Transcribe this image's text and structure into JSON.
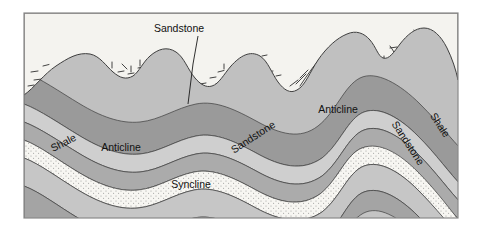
{
  "figure": {
    "type": "geologic-cross-section",
    "title_label": "Sandstone",
    "frame": {
      "x": 24,
      "y": 13,
      "width": 434,
      "height": 205,
      "border_color": "#808080"
    },
    "background_color": "#ffffff"
  },
  "labels": {
    "sandstone_top": "Sandstone",
    "shale_left": "Shale",
    "anticline_left": "Anticline",
    "sandstone_mid": "Sandstone",
    "anticline_right": "Anticline",
    "syncline": "Syncline",
    "sandstone_right": "Sandstone",
    "shale_right": "Shale"
  },
  "legend_colors": {
    "dark_gray": "#9a9a9a",
    "medium_gray": "#b0b0b0",
    "light_gray": "#c6c6c6",
    "pale_gray": "#d8d8d8",
    "sandstone_stipple": "#f4f2ee",
    "terrain": "#f2f1ec",
    "outline": "#4a4a4a"
  },
  "strata": [
    {
      "name": "shale-upper-dark",
      "fill": "#9a9a9a"
    },
    {
      "name": "limestone-light",
      "fill": "#cfcfcf"
    },
    {
      "name": "shale-medium",
      "fill": "#b0b0b0"
    },
    {
      "name": "sandstone-stippled",
      "fill": "#f6f5f1"
    },
    {
      "name": "shale-lower-light",
      "fill": "#c6c6c6"
    },
    {
      "name": "shale-lower-dark",
      "fill": "#a4a4a4"
    },
    {
      "name": "basal-light",
      "fill": "#c0c0c0"
    }
  ],
  "structures": [
    {
      "name": "anticline-left",
      "type": "anticline",
      "crest_x": 120
    },
    {
      "name": "syncline-center",
      "type": "syncline",
      "trough_x": 196
    },
    {
      "name": "anticline-right",
      "type": "anticline",
      "crest_x": 330
    }
  ]
}
